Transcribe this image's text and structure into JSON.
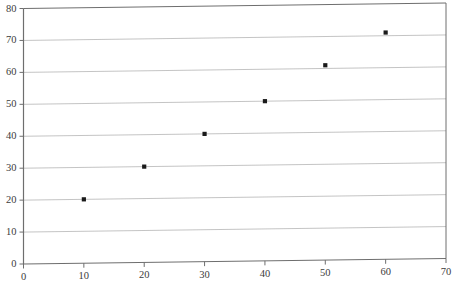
{
  "chart_data": {
    "type": "scatter",
    "title": "",
    "subtitle": "",
    "xlabel": "",
    "ylabel": "",
    "xlim": [
      0,
      70
    ],
    "ylim": [
      0,
      80
    ],
    "xticks": [
      0,
      10,
      20,
      30,
      40,
      50,
      60,
      70
    ],
    "yticks": [
      0,
      10,
      20,
      30,
      40,
      50,
      60,
      70,
      80
    ],
    "xtick_labels": [
      "0",
      "10",
      "20",
      "30",
      "40",
      "50",
      "60",
      "70"
    ],
    "ytick_labels": [
      "0",
      "10",
      "20",
      "30",
      "40",
      "50",
      "60",
      "70",
      "80"
    ],
    "grid": "horizontal",
    "legend": "none",
    "annotations": [],
    "series": [
      {
        "name": "",
        "marker": "square",
        "marker_color": "#1a1a1a",
        "points": [
          {
            "x": 10,
            "y": 20
          },
          {
            "x": 20,
            "y": 30
          },
          {
            "x": 30,
            "y": 40
          },
          {
            "x": 40,
            "y": 50
          },
          {
            "x": 50,
            "y": 61
          },
          {
            "x": 60,
            "y": 71
          }
        ]
      }
    ]
  },
  "style": {
    "background": "#ffffff",
    "axis_color": "#6e6e6e",
    "grid_color": "#b9b9b9",
    "label_color": "#3b3b3b",
    "marker_color": "#1a1a1a"
  }
}
